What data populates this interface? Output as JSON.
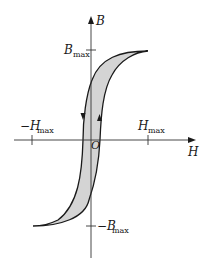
{
  "diagram": {
    "type": "hysteresis-loop",
    "axes": {
      "x_label": "H",
      "y_label": "B",
      "origin_label": "O"
    },
    "ticks": {
      "h_max": {
        "main": "H",
        "sub": "max"
      },
      "neg_h_max": {
        "main": "−H",
        "sub": "max"
      },
      "b_max": {
        "main": "B",
        "sub": "max"
      },
      "neg_b_max": {
        "main": "−B",
        "sub": "max"
      }
    },
    "colors": {
      "loop_fill": "#d4d4d4",
      "stroke": "#1a1a1a",
      "axis": "#333333"
    }
  }
}
